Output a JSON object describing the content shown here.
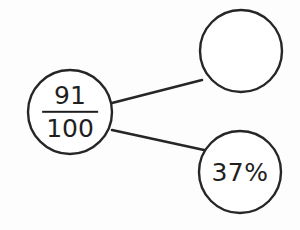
{
  "diagram": {
    "type": "bubble-map",
    "background_color": "#fdfdfd",
    "stroke_color": "#262626",
    "text_color": "#1f1f1f",
    "width": 300,
    "height": 230,
    "nodes": [
      {
        "id": "root",
        "role": "source-value",
        "label_kind": "fraction",
        "numerator": "91",
        "denominator": "100",
        "text": "91/100",
        "cx": 70,
        "cy": 112,
        "r": 42,
        "empty": false
      },
      {
        "id": "answer-blank",
        "role": "blank-answer",
        "label_kind": "empty",
        "text": "",
        "cx": 241,
        "cy": 51,
        "r": 41,
        "empty": true
      },
      {
        "id": "percent",
        "role": "percent-value",
        "label_kind": "text",
        "text": "37%",
        "cx": 240,
        "cy": 172,
        "r": 41,
        "empty": false
      }
    ],
    "connectors": [
      {
        "id": "root-to-blank",
        "from": "root",
        "to": "answer-blank",
        "x1": 112,
        "y1": 103,
        "x2": 202,
        "y2": 80
      },
      {
        "id": "root-to-percent",
        "from": "root",
        "to": "percent",
        "x1": 112,
        "y1": 130,
        "x2": 204,
        "y2": 150
      }
    ]
  }
}
